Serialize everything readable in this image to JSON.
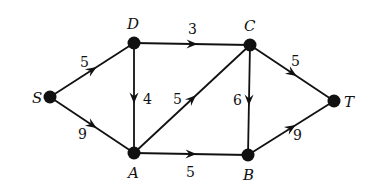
{
  "diagram": {
    "type": "directed-weighted-graph",
    "colors": {
      "stroke": "#111111",
      "background": "#ffffff"
    },
    "nodes": [
      {
        "id": "S",
        "label": "S",
        "x": 50,
        "y": 97,
        "label_x": 32,
        "label_y": 103
      },
      {
        "id": "D",
        "label": "D",
        "x": 134,
        "y": 43,
        "label_x": 127,
        "label_y": 29
      },
      {
        "id": "C",
        "label": "C",
        "x": 250,
        "y": 45,
        "label_x": 244,
        "label_y": 31
      },
      {
        "id": "A",
        "label": "A",
        "x": 134,
        "y": 153,
        "label_x": 128,
        "label_y": 178
      },
      {
        "id": "B",
        "label": "B",
        "x": 248,
        "y": 155,
        "label_x": 243,
        "label_y": 180
      },
      {
        "id": "T",
        "label": "T",
        "x": 334,
        "y": 101,
        "label_x": 344,
        "label_y": 107
      }
    ],
    "edges": [
      {
        "from": "S",
        "to": "D",
        "weight": "5",
        "label_x": 80,
        "label_y": 67
      },
      {
        "from": "S",
        "to": "A",
        "weight": "9",
        "label_x": 78,
        "label_y": 139
      },
      {
        "from": "D",
        "to": "C",
        "weight": "3",
        "label_x": 188,
        "label_y": 34
      },
      {
        "from": "D",
        "to": "A",
        "weight": "4",
        "label_x": 143,
        "label_y": 104
      },
      {
        "from": "A",
        "to": "C",
        "weight": "5",
        "label_x": 173,
        "label_y": 104
      },
      {
        "from": "A",
        "to": "B",
        "weight": "5",
        "label_x": 186,
        "label_y": 177
      },
      {
        "from": "C",
        "to": "B",
        "weight": "6",
        "label_x": 233,
        "label_y": 105
      },
      {
        "from": "C",
        "to": "T",
        "weight": "5",
        "label_x": 291,
        "label_y": 66
      },
      {
        "from": "B",
        "to": "T",
        "weight": "9",
        "label_x": 293,
        "label_y": 140
      }
    ]
  }
}
